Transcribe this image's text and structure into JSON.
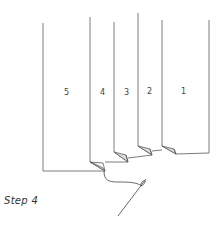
{
  "diagram": {
    "caption": "Step 4",
    "panels": [
      {
        "label": "5"
      },
      {
        "label": "4"
      },
      {
        "label": "3"
      },
      {
        "label": "2"
      },
      {
        "label": "1"
      }
    ],
    "elements": [
      "folded-pages",
      "thread",
      "needle"
    ],
    "colors": {
      "line": "#555555",
      "fold_shade": "#d9d9d9",
      "background": "#ffffff"
    }
  }
}
